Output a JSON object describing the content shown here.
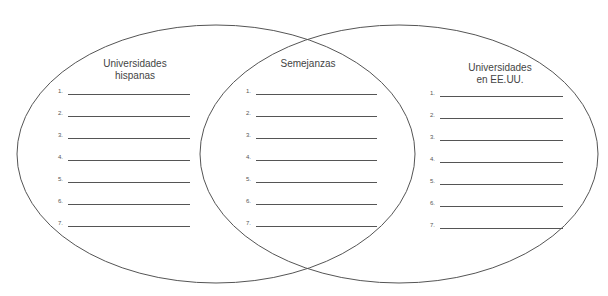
{
  "diagram": {
    "type": "venn",
    "circles": [
      {
        "id": "left",
        "title_line1": "Universidades",
        "title_line2": "hispanas"
      },
      {
        "id": "center",
        "title_line1": "Semejanzas"
      },
      {
        "id": "right",
        "title_line1": "Universidades",
        "title_line2": "en EE.UU."
      }
    ],
    "left_items": [
      "1.",
      "2.",
      "3.",
      "4.",
      "5.",
      "6.",
      "7."
    ],
    "center_items": [
      "1.",
      "2.",
      "3.",
      "4.",
      "5.",
      "6.",
      "7."
    ],
    "right_items": [
      "1.",
      "2.",
      "3.",
      "4.",
      "5.",
      "6.",
      "7."
    ],
    "stroke_color": "#555555"
  }
}
